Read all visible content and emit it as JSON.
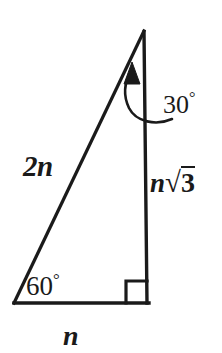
{
  "figure": {
    "background_color": "#ffffff",
    "stroke_color": "#1a1a1a",
    "labels": {
      "hypotenuse": "2n",
      "vertical_side_prefix": "n",
      "vertical_side_radical": "√",
      "vertical_side_radicand": "3",
      "vertical_side_full": "n√3",
      "base": "n",
      "angle_bottom_left": "60",
      "angle_bottom_left_full": "60°",
      "angle_apex": "30",
      "angle_apex_full": "30°",
      "degree_symbol": "°"
    },
    "geometry": {
      "apex": [
        144,
        31
      ],
      "bottom_left": [
        14,
        303
      ],
      "bottom_right": [
        148,
        303
      ],
      "right_angle_marker_size": 22,
      "line_width": 3
    },
    "annotations": {
      "arrow_name": "curved-leader-arrow",
      "arrow_tip": [
        133,
        70
      ],
      "right_angle_name": "right-angle-marker"
    }
  }
}
